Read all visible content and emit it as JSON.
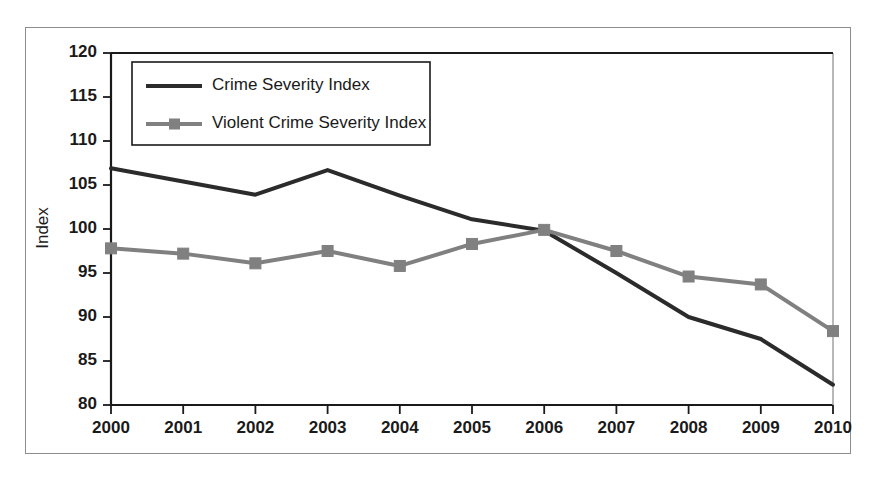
{
  "chart_data": {
    "type": "line",
    "title": "",
    "subtitle": "",
    "xlabel": "",
    "ylabel": "Index",
    "categories": [
      "2000",
      "2001",
      "2002",
      "2003",
      "2004",
      "2005",
      "2006",
      "2007",
      "2008",
      "2009",
      "2010"
    ],
    "x": [
      2000,
      2001,
      2002,
      2003,
      2004,
      2005,
      2006,
      2007,
      2008,
      2009,
      2010
    ],
    "xlim": [
      2000,
      2010
    ],
    "ylim": [
      80,
      120
    ],
    "yticks": [
      80,
      85,
      90,
      95,
      100,
      105,
      110,
      115,
      120
    ],
    "xticks": [
      "2000",
      "2001",
      "2002",
      "2003",
      "2004",
      "2005",
      "2006",
      "2007",
      "2008",
      "2009",
      "2010"
    ],
    "grid": false,
    "legend_position": "upper-left-inside",
    "series": [
      {
        "name": "Crime Severity Index",
        "color": "#2b2b2b",
        "marker": "none",
        "line_width": 4,
        "values": [
          106.9,
          105.4,
          103.9,
          106.7,
          103.8,
          101.1,
          99.8,
          95.0,
          90.0,
          87.5,
          82.3
        ]
      },
      {
        "name": "Violent Crime Severity Index",
        "color": "#808080",
        "marker": "square",
        "line_width": 4,
        "values": [
          97.8,
          97.2,
          96.1,
          97.5,
          95.8,
          98.3,
          99.9,
          97.5,
          94.6,
          93.7,
          88.4
        ]
      }
    ],
    "annotations": []
  },
  "legend": {
    "entries": [
      {
        "label": "Crime Severity Index"
      },
      {
        "label": "Violent Crime Severity Index"
      }
    ]
  },
  "axis": {
    "y_title": "Index",
    "y_tick_labels": [
      "120",
      "115",
      "110",
      "105",
      "100",
      "95",
      "90",
      "85",
      "80"
    ],
    "x_tick_labels": [
      "2000",
      "2001",
      "2002",
      "2003",
      "2004",
      "2005",
      "2006",
      "2007",
      "2008",
      "2009",
      "2010"
    ]
  },
  "colors": {
    "series_primary": "#2b2b2b",
    "series_secondary": "#808080",
    "frame": "#8d8d8d",
    "axis": "#1a1a1a",
    "background": "#ffffff"
  }
}
